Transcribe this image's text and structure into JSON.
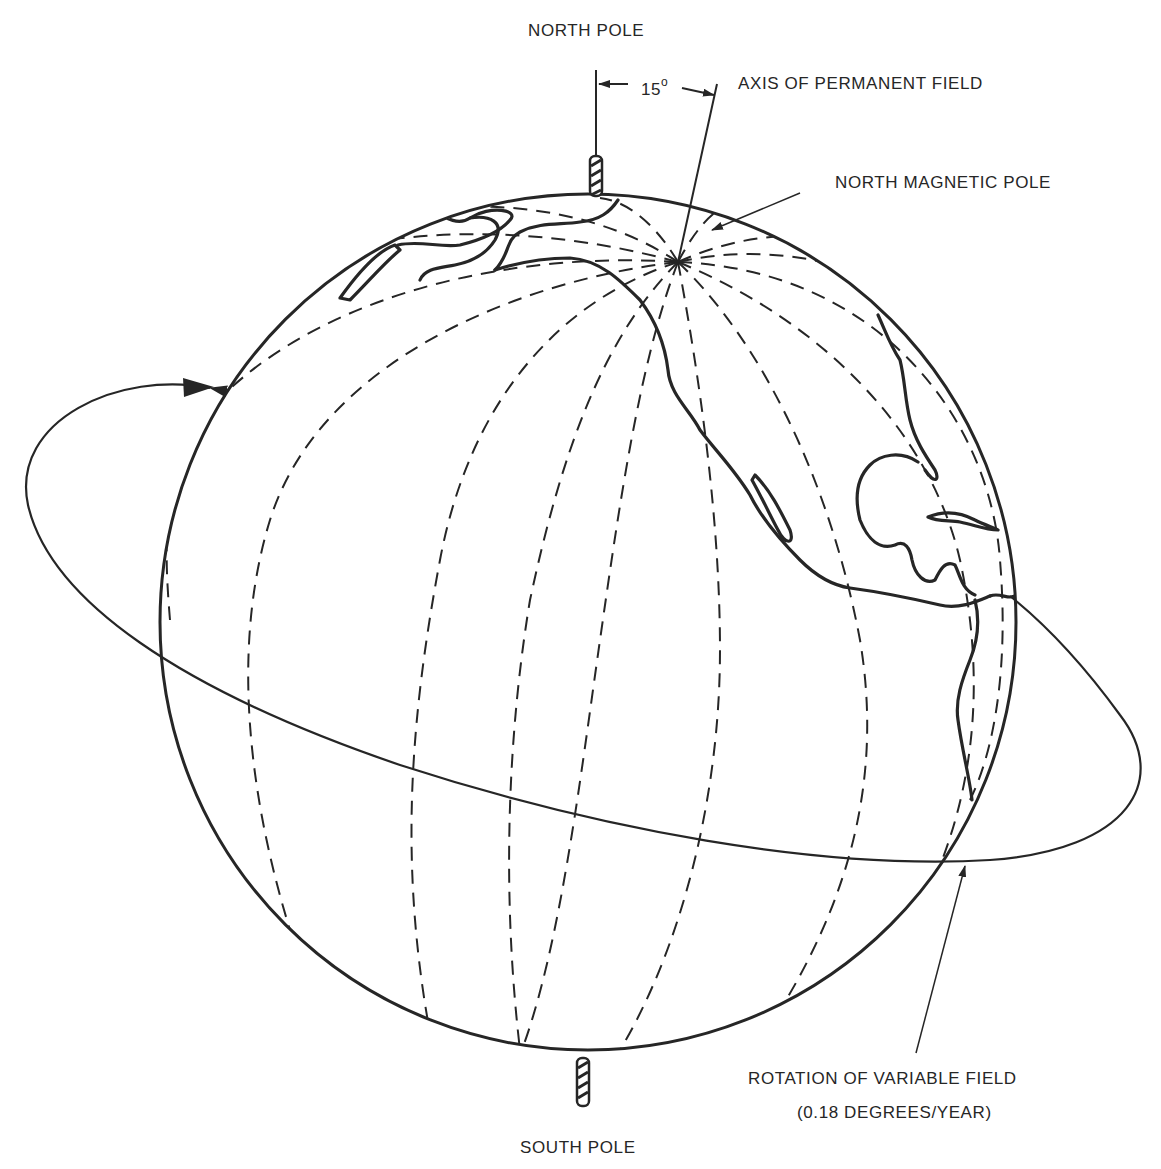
{
  "figure": {
    "type": "diagram"
  },
  "labels": {
    "north_pole": "NORTH POLE",
    "south_pole": "SOUTH POLE",
    "angle_value": "15",
    "angle_unit": "o",
    "axis_permanent_field": "AXIS OF PERMANENT FIELD",
    "north_magnetic_pole": "NORTH MAGNETIC POLE",
    "rotation_variable_field": "ROTATION OF VARIABLE FIELD",
    "rotation_rate": "(0.18 DEGREES/YEAR)"
  },
  "geometry": {
    "globe_center": [
      588,
      622
    ],
    "globe_radius": 428,
    "geographic_axis_tilt_deg": 0,
    "magnetic_axis_offset_deg": 15,
    "magnetic_pole_point": [
      678,
      262
    ],
    "orbit_ellipse": {
      "cx": 580,
      "cy": 668,
      "rx": 567,
      "ry": 175,
      "rotation_deg": 12
    }
  },
  "colors": {
    "ink": "#262626",
    "background": "#ffffff"
  }
}
